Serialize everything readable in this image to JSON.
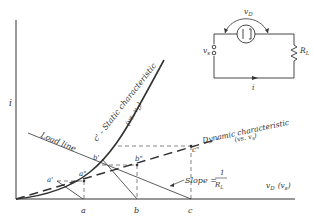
{
  "diagram": {
    "axes": {
      "y_label": "i",
      "x_label": "v",
      "x_label_sub": "D",
      "x_label_paren": "(v",
      "x_label_paren_sub": "s",
      "x_label_paren_close": ")"
    },
    "ticks": {
      "a": "a",
      "b": "b",
      "c": "c"
    },
    "curves": {
      "static": "c' - Static characteristic",
      "static_sub": "(vs. v",
      "static_sub_d": "D",
      "static_sub_close": ")",
      "dynamic": "Dynamic characteristic",
      "dynamic_sub": "(vs. v",
      "dynamic_sub_s": "s",
      "dynamic_sub_close": ")",
      "load_line": "Load line"
    },
    "points": {
      "a1": "a'",
      "b1": "b'",
      "a2": "a\"",
      "b2": "b\"",
      "c2": "c\""
    },
    "slope": {
      "label": "Slope =",
      "num": "1",
      "den": "R",
      "den_sub": "L"
    },
    "circuit": {
      "vd": "v",
      "vd_sub": "D",
      "vs": "v",
      "vs_sub": "s",
      "rl": "R",
      "rl_sub": "L",
      "i": "i"
    },
    "colors": {
      "ink": "#333333",
      "background": "#ffffff"
    }
  }
}
